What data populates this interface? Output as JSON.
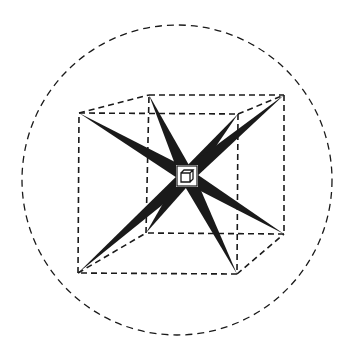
{
  "diagram": {
    "type": "tesseract-like cube with radiating spikes inside dashed circle",
    "colors": {
      "background": "#ffffff",
      "ink": "#1a1a1a"
    },
    "circle": {
      "cx": 177,
      "cy": 180,
      "r": 155,
      "style": "dashed"
    },
    "outer_cube": {
      "front": [
        [
          79,
          113
        ],
        [
          238,
          114
        ],
        [
          237,
          274
        ],
        [
          78,
          273
        ]
      ],
      "back": [
        [
          149,
          95
        ],
        [
          284,
          95
        ],
        [
          284,
          234
        ],
        [
          146,
          233
        ]
      ],
      "style": "dashed"
    },
    "center": {
      "x": 187,
      "y": 176,
      "label": ""
    },
    "spikes": [
      {
        "to": [
          79,
          113
        ]
      },
      {
        "to": [
          149,
          95
        ]
      },
      {
        "to": [
          238,
          114
        ]
      },
      {
        "to": [
          284,
          95
        ]
      },
      {
        "to": [
          284,
          234
        ]
      },
      {
        "to": [
          237,
          274
        ]
      },
      {
        "to": [
          78,
          273
        ]
      },
      {
        "to": [
          146,
          233
        ]
      }
    ]
  }
}
